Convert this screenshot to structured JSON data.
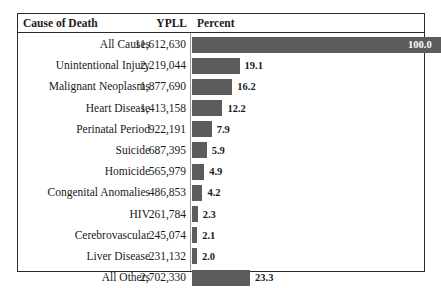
{
  "table": {
    "columns": {
      "cause": "Cause of Death",
      "ypll": "YPLL",
      "percent": "Percent"
    },
    "rows": [
      {
        "cause": "All Causes",
        "ypll": "11,612,630",
        "percent": "100.0"
      },
      {
        "cause": "Unintentional Injury",
        "ypll": "2,219,044",
        "percent": "19.1"
      },
      {
        "cause": "Malignant Neoplasms",
        "ypll": "1,877,690",
        "percent": "16.2"
      },
      {
        "cause": "Heart Disease",
        "ypll": "1,413,158",
        "percent": "12.2"
      },
      {
        "cause": "Perinatal Period",
        "ypll": "922,191",
        "percent": "7.9"
      },
      {
        "cause": "Suicide",
        "ypll": "687,395",
        "percent": "5.9"
      },
      {
        "cause": "Homicide",
        "ypll": "565,979",
        "percent": "4.9"
      },
      {
        "cause": "Congenital Anomalies",
        "ypll": "486,853",
        "percent": "4.2"
      },
      {
        "cause": "HIV",
        "ypll": "261,784",
        "percent": "2.3"
      },
      {
        "cause": "Cerebrovascular",
        "ypll": "245,074",
        "percent": "2.1"
      },
      {
        "cause": "Liver Disease",
        "ypll": "231,132",
        "percent": "2.0"
      },
      {
        "cause": "All Others",
        "ypll": "2,702,330",
        "percent": "23.3"
      }
    ]
  },
  "chart_data": {
    "type": "bar",
    "orientation": "horizontal",
    "title": "",
    "xlabel": "Percent",
    "ylabel": "Cause of Death",
    "xlim": [
      0,
      100
    ],
    "grid": false,
    "legend": null,
    "bar_color": "#5c5c5c",
    "categories": [
      "All Causes",
      "Unintentional Injury",
      "Malignant Neoplasms",
      "Heart Disease",
      "Perinatal Period",
      "Suicide",
      "Homicide",
      "Congenital Anomalies",
      "HIV",
      "Cerebrovascular",
      "Liver Disease",
      "All Others"
    ],
    "values": [
      100.0,
      19.1,
      16.2,
      12.2,
      7.9,
      5.9,
      4.9,
      4.2,
      2.3,
      2.1,
      2.0,
      23.3
    ],
    "series": [
      {
        "name": "Percent",
        "values": [
          100.0,
          19.1,
          16.2,
          12.2,
          7.9,
          5.9,
          4.9,
          4.2,
          2.3,
          2.1,
          2.0,
          23.3
        ]
      },
      {
        "name": "YPLL",
        "values": [
          11612630,
          2219044,
          1877690,
          1413158,
          922191,
          687395,
          565979,
          486853,
          261784,
          245074,
          231132,
          2702330
        ]
      }
    ],
    "data_labels": [
      "100.0",
      "19.1",
      "16.2",
      "12.2",
      "7.9",
      "5.9",
      "4.9",
      "4.2",
      "2.3",
      "2.1",
      "2.0",
      "23.3"
    ]
  }
}
